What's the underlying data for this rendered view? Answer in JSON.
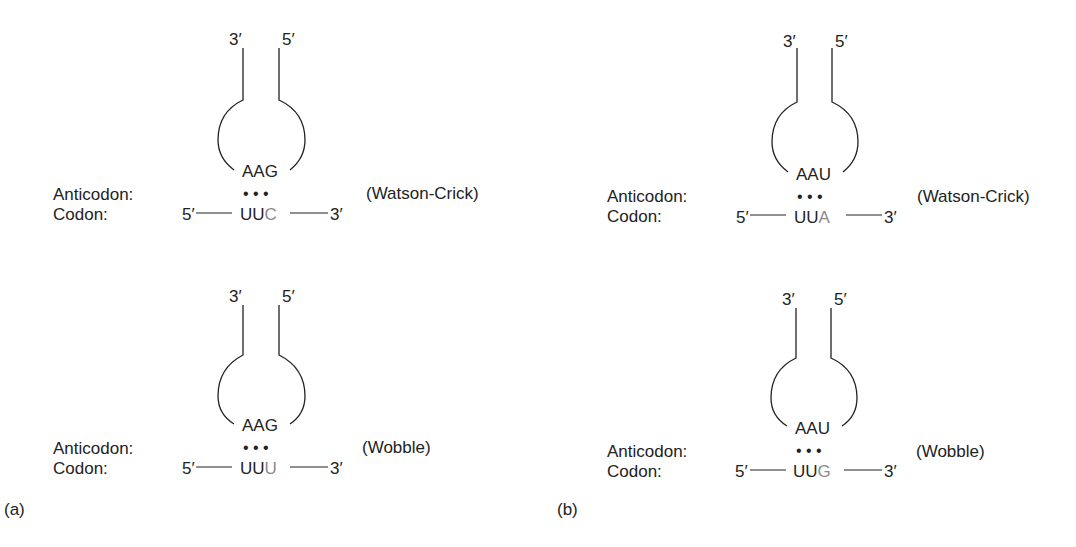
{
  "figure": {
    "panels": [
      {
        "id": "a",
        "label": "(a)",
        "diagrams": [
          {
            "type": "Watson-Crick",
            "pairing_label": "(Watson-Crick)",
            "trna_end_left": "3′",
            "trna_end_right": "5′",
            "anticodon": "AAG",
            "anticodon_label": "Anticodon:",
            "codon_label": "Codon:",
            "codon_5prime": "5′",
            "codon_3prime": "3′",
            "codon_fixed": "UU",
            "codon_wobble_base": "C",
            "bond_dots": "• • •"
          },
          {
            "type": "Wobble",
            "pairing_label": "(Wobble)",
            "trna_end_left": "3′",
            "trna_end_right": "5′",
            "anticodon": "AAG",
            "anticodon_label": "Anticodon:",
            "codon_label": "Codon:",
            "codon_5prime": "5′",
            "codon_3prime": "3′",
            "codon_fixed": "UU",
            "codon_wobble_base": "U",
            "bond_dots": "• • •"
          }
        ]
      },
      {
        "id": "b",
        "label": "(b)",
        "diagrams": [
          {
            "type": "Watson-Crick",
            "pairing_label": "(Watson-Crick)",
            "trna_end_left": "3′",
            "trna_end_right": "5′",
            "anticodon": "AAU",
            "anticodon_label": "Anticodon:",
            "codon_label": "Codon:",
            "codon_5prime": "5′",
            "codon_3prime": "3′",
            "codon_fixed": "UU",
            "codon_wobble_base": "A",
            "bond_dots": "• • •"
          },
          {
            "type": "Wobble",
            "pairing_label": "(Wobble)",
            "trna_end_left": "3′",
            "trna_end_right": "5′",
            "anticodon": "AAU",
            "anticodon_label": "Anticodon:",
            "codon_label": "Codon:",
            "codon_5prime": "5′",
            "codon_3prime": "3′",
            "codon_fixed": "UU",
            "codon_wobble_base": "G",
            "bond_dots": "• • •"
          }
        ]
      }
    ],
    "colors": {
      "text": "#222222",
      "wobble_base": "#8a8a8a"
    }
  }
}
